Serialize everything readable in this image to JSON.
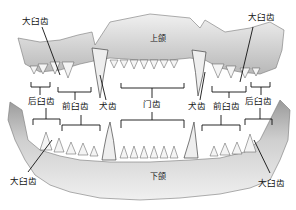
{
  "jaws": {
    "upper": "上颌",
    "lower": "下颌"
  },
  "labels": {
    "upper_left_carnassial": "大臼齿",
    "upper_right_carnassial": "大臼齿",
    "left_molar": "后臼齿",
    "left_premolar": "前臼齿",
    "left_canine": "犬齿",
    "incisors": "门齿",
    "right_canine": "犬齿",
    "right_premolar": "前臼齿",
    "right_molar": "后臼齿",
    "lower_left_carnassial": "大臼齿",
    "lower_right_carnassial": "大臼齿"
  },
  "colors": {
    "bone": "#d9d9d9",
    "bone_shadow": "#a8a8a8",
    "tooth": "#f2f2f2",
    "line": "#111111"
  }
}
